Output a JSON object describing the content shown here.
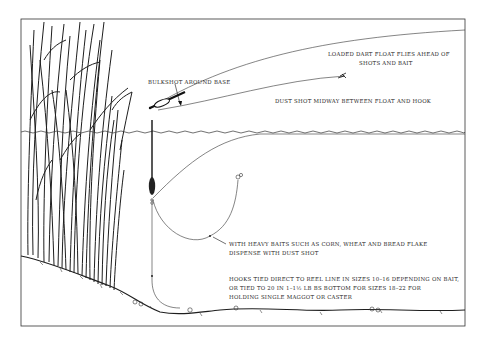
{
  "diagram": {
    "colors": {
      "ink": "#1e1e1e",
      "background": "#ffffff"
    },
    "labels": {
      "loaded_float": [
        "LOADED DART FLOAT FLIES AHEAD OF",
        "SHOTS AND BAIT"
      ],
      "bulkshot": "BULKSHOT AROUND BASE",
      "dust_shot": "DUST SHOT MIDWAY BETWEEN FLOAT AND HOOK",
      "heavy_baits": [
        "WITH HEAVY BAITS SUCH AS CORN, WHEAT AND BREAD FLAKE",
        "DISPENSE WITH DUST SHOT"
      ],
      "hooks": [
        "HOOKS TIED DIRECT TO REEL LINE IN SIZES 10–16 DEPENDING ON BAIT,",
        "OR TIED TO 20 IN 1–1½ LB BS BOTTOM FOR SIZES 18–22 FOR",
        "HOLDING SINGLE MAGGOT OR CASTER"
      ]
    },
    "elements": [
      "reeds",
      "water-surface",
      "bankside-slope",
      "river-bed",
      "flying-dart-float",
      "settled-float",
      "hook-with-bait",
      "fishing-line"
    ]
  }
}
